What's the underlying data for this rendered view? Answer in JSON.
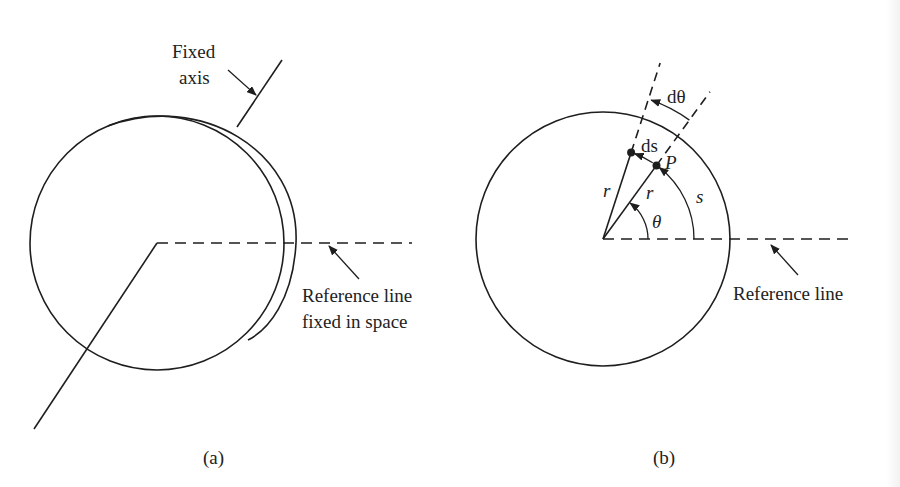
{
  "figure": {
    "panel_a": {
      "caption": "(a)",
      "fixed_axis_label_line1": "Fixed",
      "fixed_axis_label_line2": "axis",
      "reference_label_line1": "Reference line",
      "reference_label_line2": "fixed in space"
    },
    "panel_b": {
      "caption": "(b)",
      "reference_label": "Reference line",
      "symbols": {
        "d_theta": "dθ",
        "ds": "ds",
        "point": "P",
        "radius_1": "r",
        "radius_2": "r",
        "arc_length": "s",
        "angle": "θ"
      },
      "angle_theta_deg": 54,
      "angle_theta_plus_dtheta_deg": 72
    },
    "left_margin_fragments": [
      "f",
      "e",
      "e"
    ]
  }
}
